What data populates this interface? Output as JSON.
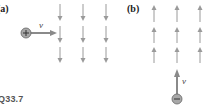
{
  "figure": {
    "label": "Q33.7",
    "panels": [
      {
        "label": "(a)",
        "field_direction": "down",
        "field_columns_x": [
          60,
          83,
          106
        ],
        "charge": {
          "sign": "+",
          "symbol": "+",
          "x": 26,
          "y": 33
        },
        "velocity": {
          "label": "v⃗",
          "direction": "right"
        }
      },
      {
        "label": "(b)",
        "field_direction": "up",
        "field_columns_x": [
          154,
          177,
          200
        ],
        "charge": {
          "sign": "-",
          "symbol": "−",
          "x": 177,
          "y": 99
        },
        "velocity": {
          "label": "v⃗",
          "direction": "up"
        }
      }
    ],
    "colors": {
      "field_arrow": "#9a9a9a",
      "velocity_arrow": "#8a8a8a",
      "charge_fill": "#a8a8a8",
      "charge_stroke": "#666666"
    }
  }
}
